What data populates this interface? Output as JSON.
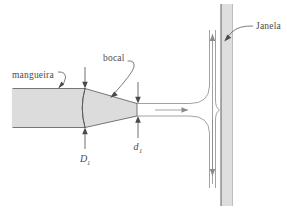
{
  "figure": {
    "background_color": "#ffffff",
    "width": 287,
    "height": 210
  },
  "colors": {
    "body_fill": "#dcdcdc",
    "wall_fill": "#dedede",
    "outline": "#555555",
    "text": "#4a4a4a",
    "flow_line": "#8a8a8a",
    "leader": "#5a5a5a"
  },
  "labels": {
    "hose": "mangueira",
    "nozzle": "bocal",
    "window": "Janela",
    "hose_diameter": "D",
    "hose_diameter_subscript": "1",
    "nozzle_diameter": "d",
    "nozzle_diameter_subscript": "1"
  },
  "parts": [
    {
      "id": "hose",
      "name": "mangueira",
      "label": "mangueira"
    },
    {
      "id": "nozzle",
      "name": "bocal",
      "label": "bocal"
    },
    {
      "id": "window",
      "name": "janela",
      "label": "Janela"
    },
    {
      "id": "jet",
      "name": "jato",
      "label": ""
    }
  ],
  "dimensions": [
    {
      "id": "D1",
      "symbol": "D",
      "subscript": "1",
      "applies_to": "mangueira"
    },
    {
      "id": "d1",
      "symbol": "d",
      "subscript": "1",
      "applies_to": "bocal"
    }
  ],
  "flow_arrows": [
    {
      "id": "jet-arrow",
      "direction": "right",
      "label": ""
    },
    {
      "id": "wall-arrow-up",
      "direction": "up",
      "label": ""
    },
    {
      "id": "wall-arrow-down",
      "direction": "down",
      "label": ""
    }
  ]
}
